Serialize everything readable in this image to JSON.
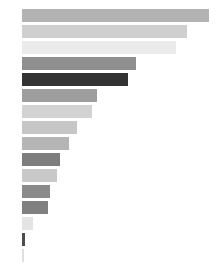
{
  "chart_data": {
    "type": "bar",
    "orientation": "horizontal",
    "title": "",
    "subtitle": "",
    "xlabel": "",
    "ylabel": "",
    "grid": false,
    "legend": null,
    "xlim": [
      0,
      195
    ],
    "axis_ticks": [],
    "categories": [
      "",
      "",
      "",
      "",
      "",
      "",
      "",
      "",
      "",
      "",
      "",
      "",
      "",
      "",
      "",
      ""
    ],
    "values": [
      190,
      168,
      156,
      116,
      108,
      76,
      71,
      56,
      48,
      39,
      36,
      28,
      26,
      11,
      3,
      2
    ],
    "colors": [
      "#b3b3b3",
      "#cfcfcf",
      "#ebebeb",
      "#8f8f8f",
      "#333333",
      "#9e9e9e",
      "#d2d2d2",
      "#c6c6c6",
      "#b5b5b5",
      "#7d7d7d",
      "#c9c9c9",
      "#8a8a8a",
      "#808080",
      "#e4e4e4",
      "#4d4d4d",
      "#e0e0e0"
    ],
    "bar_labels": [
      "",
      "",
      "",
      "",
      "",
      "",
      "",
      "",
      "",
      "",
      "",
      "",
      "",
      "",
      "",
      ""
    ],
    "label_colors": [
      "#c2c2c2",
      "#dcdcdc",
      "#f4f4f4",
      "#9e9e9e",
      "#4a4a4a",
      "#adadad",
      "#dedede",
      "#d4d4d4",
      "#c4c4c4",
      "#909090",
      "#d6d6d6",
      "#9a9a9a",
      "#8f8f8f",
      "#ededed",
      "#5e5e5e",
      "#ebebeb"
    ],
    "bar_geometry": {
      "plot_left_px": 22,
      "plot_top_px": 9,
      "bar_height_px": 13,
      "bar_gap_px": 3,
      "canvas_width_px": 219,
      "canvas_height_px": 278
    }
  }
}
